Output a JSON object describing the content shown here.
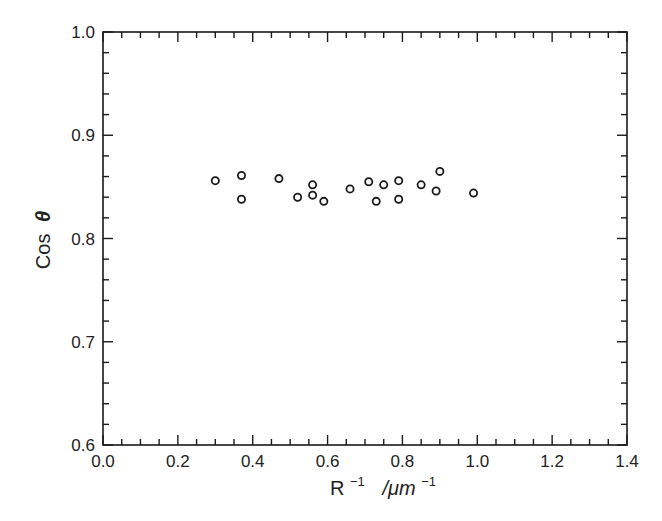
{
  "chart_data": {
    "type": "scatter",
    "title": "",
    "xlabel": "R^-1 / µm^-1",
    "ylabel": "Cos θ",
    "xlabel_parts": {
      "base": "R",
      "sup1": "−1",
      "unit": "/μm",
      "sup2": "−1"
    },
    "ylabel_parts": {
      "text": "Cos",
      "symbol": "θ"
    },
    "xlim": [
      0.0,
      1.4
    ],
    "ylim": [
      0.6,
      1.0
    ],
    "x_ticks": [
      "0.0",
      "0.2",
      "0.4",
      "0.6",
      "0.8",
      "1.0",
      "1.2",
      "1.4"
    ],
    "y_ticks": [
      "0.6",
      "0.7",
      "0.8",
      "0.9",
      "1.0"
    ],
    "x_minor_step": 0.05,
    "y_minor_step": 0.02,
    "grid": false,
    "legend": null,
    "marker": "open-circle",
    "series": [
      {
        "name": "data",
        "points": [
          {
            "x": 0.3,
            "y": 0.856
          },
          {
            "x": 0.37,
            "y": 0.861
          },
          {
            "x": 0.37,
            "y": 0.838
          },
          {
            "x": 0.47,
            "y": 0.858
          },
          {
            "x": 0.52,
            "y": 0.84
          },
          {
            "x": 0.56,
            "y": 0.852
          },
          {
            "x": 0.56,
            "y": 0.842
          },
          {
            "x": 0.59,
            "y": 0.836
          },
          {
            "x": 0.66,
            "y": 0.848
          },
          {
            "x": 0.71,
            "y": 0.855
          },
          {
            "x": 0.73,
            "y": 0.836
          },
          {
            "x": 0.75,
            "y": 0.852
          },
          {
            "x": 0.79,
            "y": 0.856
          },
          {
            "x": 0.79,
            "y": 0.838
          },
          {
            "x": 0.85,
            "y": 0.852
          },
          {
            "x": 0.89,
            "y": 0.846
          },
          {
            "x": 0.9,
            "y": 0.865
          },
          {
            "x": 0.99,
            "y": 0.844
          }
        ]
      }
    ]
  },
  "colors": {
    "axis": "#1a1a1a",
    "marker": "#1a1a1a",
    "background": "#ffffff"
  }
}
